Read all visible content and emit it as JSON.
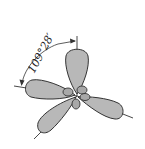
{
  "diagram": {
    "angle_label": "109°28′",
    "colors": {
      "lobe_fill": "#b8b8b8",
      "outline": "#333333",
      "background": "#ffffff"
    },
    "lobes": [
      {
        "direction": "up"
      },
      {
        "direction": "left"
      },
      {
        "direction": "lower-left"
      },
      {
        "direction": "lower-right"
      }
    ]
  }
}
